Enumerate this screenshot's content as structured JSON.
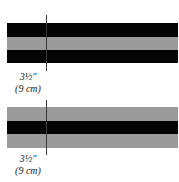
{
  "diagram": {
    "top_strip": {
      "bands": [
        "black",
        "grey",
        "black"
      ],
      "measurement": {
        "imperial": "3½″",
        "metric": "(9 cm)"
      }
    },
    "bottom_strip": {
      "bands": [
        "grey",
        "black",
        "grey"
      ],
      "measurement": {
        "imperial": "3½″",
        "metric": "(9 cm)"
      }
    },
    "colors": {
      "black": "#050505",
      "grey": "#9b9b9b"
    }
  }
}
